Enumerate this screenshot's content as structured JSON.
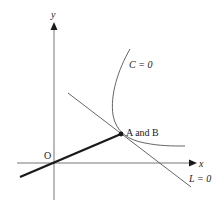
{
  "diagram": {
    "axes": {
      "x_label": "x",
      "y_label": "y",
      "origin_label": "O"
    },
    "curve": {
      "label": "C = 0"
    },
    "line": {
      "label": "L = 0"
    },
    "point": {
      "label": "A and B"
    },
    "colors": {
      "axis": "#666666",
      "curve": "#555555",
      "line": "#555555",
      "thick_segment": "#1a1a1a",
      "text": "#222222"
    }
  }
}
